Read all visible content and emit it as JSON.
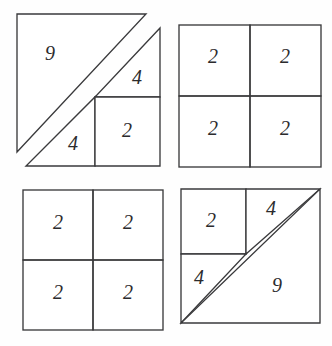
{
  "figure": {
    "background_color": "#fefefe",
    "line_color": "#3a3a3c",
    "label_color": "#2b2b2d",
    "panels": [
      {
        "id": "top-left",
        "name": "triangle-dissection-offset",
        "description": "Right triangle dissected into two triangles and a square with an offset diagonal",
        "pieces": [
          {
            "name": "large-triangle",
            "label": "9",
            "label_x": 50,
            "label_y": 55
          },
          {
            "name": "upper-small-triangle",
            "label": "4",
            "label_x": 137,
            "label_y": 79
          },
          {
            "name": "lower-small-triangle",
            "label": "4",
            "label_x": 73,
            "label_y": 145
          },
          {
            "name": "inner-square",
            "label": "2",
            "label_x": 127,
            "label_y": 132
          }
        ]
      },
      {
        "id": "top-right",
        "name": "square-grid-four-cells",
        "description": "Two by two grid of unit squares",
        "pieces": [
          {
            "name": "cell-top-left",
            "label": "2",
            "label_x": 213,
            "label_y": 58
          },
          {
            "name": "cell-top-right",
            "label": "2",
            "label_x": 285,
            "label_y": 58
          },
          {
            "name": "cell-bottom-left",
            "label": "2",
            "label_x": 213,
            "label_y": 130
          },
          {
            "name": "cell-bottom-right",
            "label": "2",
            "label_x": 285,
            "label_y": 130
          }
        ]
      },
      {
        "id": "bottom-left",
        "name": "square-grid-four-cells",
        "description": "Two by two grid of unit squares",
        "pieces": [
          {
            "name": "cell-top-left",
            "label": "2",
            "label_x": 58,
            "label_y": 224
          },
          {
            "name": "cell-top-right",
            "label": "2",
            "label_x": 128,
            "label_y": 224
          },
          {
            "name": "cell-bottom-left",
            "label": "2",
            "label_x": 58,
            "label_y": 294
          },
          {
            "name": "cell-bottom-right",
            "label": "2",
            "label_x": 128,
            "label_y": 294
          }
        ]
      },
      {
        "id": "bottom-right",
        "name": "triangle-dissection-aligned",
        "description": "Right triangle dissected into two triangles and a square with a straight diagonal",
        "pieces": [
          {
            "name": "inner-square",
            "label": "2",
            "label_x": 211,
            "label_y": 222
          },
          {
            "name": "upper-small-triangle",
            "label": "4",
            "label_x": 271,
            "label_y": 210
          },
          {
            "name": "lower-small-triangle",
            "label": "4",
            "label_x": 199,
            "label_y": 279
          },
          {
            "name": "large-triangle",
            "label": "9",
            "label_x": 277,
            "label_y": 287
          }
        ]
      }
    ]
  }
}
